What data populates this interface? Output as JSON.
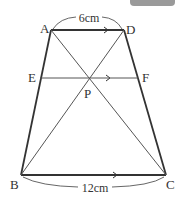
{
  "figure": {
    "type": "trapezoid",
    "points": {
      "A": {
        "label": "A",
        "x": 51,
        "y": 30
      },
      "D": {
        "label": "D",
        "x": 124,
        "y": 30
      },
      "E": {
        "label": "E",
        "x": 40,
        "y": 78
      },
      "F": {
        "label": "F",
        "x": 138,
        "y": 78
      },
      "P": {
        "label": "P",
        "x": 89,
        "y": 79
      },
      "B": {
        "label": "B",
        "x": 21,
        "y": 175
      },
      "C": {
        "label": "C",
        "x": 166,
        "y": 175
      }
    },
    "measures": {
      "AD": "6cm",
      "BC": "12cm"
    },
    "colors": {
      "line": "#333333",
      "thin_line": "#555555"
    }
  }
}
